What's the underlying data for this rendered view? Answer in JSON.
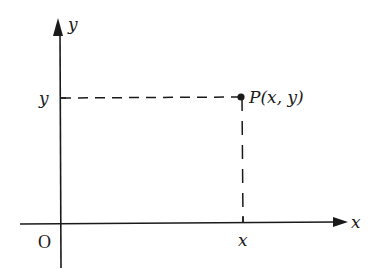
{
  "diagram": {
    "type": "cartesian-coordinate-point",
    "axes": {
      "x_label": "x",
      "y_label": "y",
      "origin_label": "O"
    },
    "point": {
      "label": "P(x, y)",
      "x_tick_label": "x",
      "y_tick_label": "y"
    },
    "colors": {
      "ink": "#1a1a1a",
      "background": "#ffffff"
    }
  }
}
